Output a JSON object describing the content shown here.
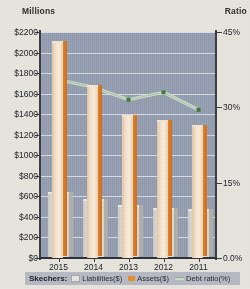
{
  "axis_titles": {
    "left": "Millions",
    "right": "Ratio"
  },
  "legend": {
    "title": "Skechers:",
    "items": [
      {
        "label": "Liabilities($)",
        "swatch": "liabilities-swatch",
        "color": "#e9e7e1"
      },
      {
        "label": "Assets($)",
        "swatch": "assets-swatch",
        "color": "#e8922f"
      },
      {
        "label": "Debt ratio(%)",
        "swatch": "debt-ratio-swatch",
        "color": "#cfe0cd"
      }
    ]
  },
  "colors": {
    "plot_background": "#97a0b4",
    "page_background": "#e9e7e0",
    "gridline": "#e4e7ee",
    "assets_bar": "#e8922f",
    "liabilities_bar": "#e9e7e1",
    "debt_ratio_line": "#cfe0cd",
    "debt_ratio_marker": "#3f7a42",
    "axis": "#3b3f46"
  },
  "chart_data": {
    "type": "bar",
    "title": "",
    "xlabel": "",
    "ylabel": "Millions",
    "y2label": "Ratio",
    "categories": [
      "2015",
      "2014",
      "2013",
      "2012",
      "2011"
    ],
    "ylim": [
      0,
      2200
    ],
    "yticks": [
      0,
      200,
      400,
      600,
      800,
      1000,
      1200,
      1400,
      1600,
      1800,
      2000,
      2200
    ],
    "ytick_labels": [
      "$0",
      "$200",
      "$400",
      "$600",
      "$800",
      "$1000",
      "$1200",
      "$1400",
      "$1600",
      "$1800",
      "$2000",
      "$2200"
    ],
    "y2lim": [
      0,
      45
    ],
    "y2ticks": [
      0,
      15,
      30,
      45
    ],
    "y2tick_labels": [
      "0.0%",
      "15%",
      "30%",
      "45%"
    ],
    "grid": true,
    "legend_position": "bottom",
    "series": [
      {
        "name": "Liabilities($)",
        "type": "bar",
        "axis": "left",
        "values": [
          620,
          555,
          500,
          470,
          455
        ]
      },
      {
        "name": "Assets($)",
        "type": "bar",
        "axis": "left",
        "values": [
          2090,
          1665,
          1375,
          1325,
          1275
        ]
      },
      {
        "name": "Debt ratio(%)",
        "type": "line",
        "axis": "right",
        "values": [
          35.5,
          34.0,
          31.5,
          33.0,
          29.5
        ]
      }
    ]
  }
}
